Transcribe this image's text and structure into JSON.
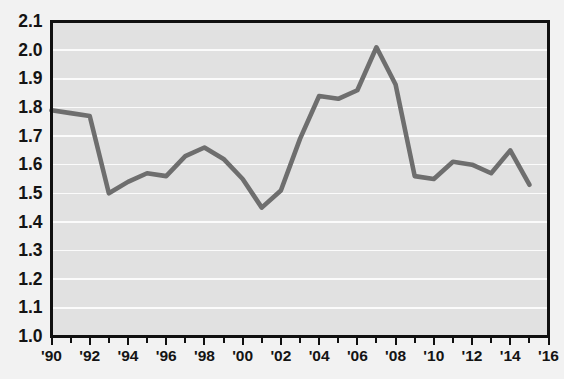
{
  "chart_data": {
    "type": "line",
    "title": "",
    "subtitle": "",
    "xlabel": "",
    "ylabel": "",
    "grid": true,
    "grid_axis": "y",
    "legend": false,
    "legend_position": "none",
    "line_color": "#6e6e6e",
    "plot_background_color": "#e1e1e1",
    "gridline_color": "#fbfbfb",
    "page_background_color": "#f2f2f2",
    "axis_color": "#101010",
    "xlim": [
      1990,
      2016
    ],
    "ylim": [
      1.0,
      2.1
    ],
    "y_tick_step": 0.1,
    "x_tick_step_minor": 1,
    "x_tick_step_labeled": 2,
    "y_tick_labels": [
      "2.1",
      "2.0",
      "1.9",
      "1.8",
      "1.7",
      "1.6",
      "1.5",
      "1.4",
      "1.3",
      "1.2",
      "1.1",
      "1.0"
    ],
    "y_tick_values": [
      2.1,
      2.0,
      1.9,
      1.8,
      1.7,
      1.6,
      1.5,
      1.4,
      1.3,
      1.2,
      1.1,
      1.0
    ],
    "x_tick_labels": [
      "'90",
      "'92",
      "'94",
      "'96",
      "'98",
      "'00",
      "'02",
      "'04",
      "'06",
      "'08",
      "'10",
      "'12",
      "'14",
      "'16"
    ],
    "x_tick_values": [
      1990,
      1992,
      1994,
      1996,
      1998,
      2000,
      2002,
      2004,
      2006,
      2008,
      2010,
      2012,
      2014,
      2016
    ],
    "x_minor_tick_values": [
      1990,
      1991,
      1992,
      1993,
      1994,
      1995,
      1996,
      1997,
      1998,
      1999,
      2000,
      2001,
      2002,
      2003,
      2004,
      2005,
      2006,
      2007,
      2008,
      2009,
      2010,
      2011,
      2012,
      2013,
      2014,
      2015,
      2016
    ],
    "x": [
      1990,
      1991,
      1992,
      1993,
      1994,
      1995,
      1996,
      1997,
      1998,
      1999,
      2000,
      2001,
      2002,
      2003,
      2004,
      2005,
      2006,
      2007,
      2008,
      2009,
      2010,
      2011,
      2012,
      2013,
      2014,
      2015
    ],
    "values": [
      1.79,
      1.78,
      1.77,
      1.5,
      1.54,
      1.57,
      1.56,
      1.63,
      1.66,
      1.62,
      1.55,
      1.45,
      1.51,
      1.69,
      1.84,
      1.83,
      1.86,
      2.01,
      1.88,
      1.56,
      1.55,
      1.61,
      1.6,
      1.57,
      1.65,
      1.53
    ],
    "series": [
      {
        "name": "series-1",
        "color": "#6e6e6e",
        "values": [
          1.79,
          1.78,
          1.77,
          1.5,
          1.54,
          1.57,
          1.56,
          1.63,
          1.66,
          1.62,
          1.55,
          1.45,
          1.51,
          1.69,
          1.84,
          1.83,
          1.86,
          2.01,
          1.88,
          1.56,
          1.55,
          1.61,
          1.6,
          1.57,
          1.65,
          1.53
        ]
      }
    ],
    "annotations": []
  }
}
